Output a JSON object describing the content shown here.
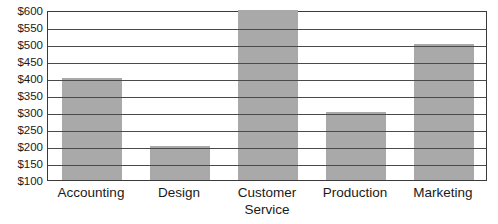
{
  "chart_data": {
    "type": "bar",
    "title": "",
    "xlabel": "",
    "ylabel": "",
    "categories": [
      "Accounting",
      "Design",
      "Customer Service",
      "Production",
      "Marketing"
    ],
    "category_lines": [
      [
        "Accounting"
      ],
      [
        "Design"
      ],
      [
        "Customer",
        "Service"
      ],
      [
        "Production"
      ],
      [
        "Marketing"
      ]
    ],
    "values": [
      400,
      200,
      600,
      300,
      500
    ],
    "value_labels": [
      "$400",
      "$200",
      "$600",
      "$300",
      "$500"
    ],
    "ylim": [
      100,
      600
    ],
    "ytick_values": [
      600,
      550,
      500,
      450,
      400,
      350,
      300,
      250,
      200,
      150,
      100
    ],
    "ytick_labels": [
      "$600",
      "$550",
      "$500",
      "$450",
      "$400",
      "$350",
      "$300",
      "$250",
      "$200",
      "$150",
      "$100"
    ],
    "grid": true,
    "legend": "none",
    "bar_color": "#a9a9a9",
    "gridline_color": "#4a4a4a",
    "axis_color": "#3a3a3a",
    "background_color": "#ffffff"
  }
}
